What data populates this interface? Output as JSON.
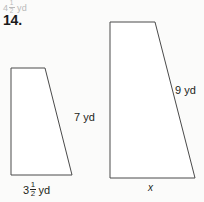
{
  "page": {
    "background_color": "#fbfbfa",
    "stroke_color": "#4a4a4a",
    "shape_fill": "#ffffff",
    "text_color": "#231f20",
    "faded_text_color": "#b9b9b9"
  },
  "carryover": {
    "whole": "4",
    "numerator": "1",
    "denominator": "2",
    "unit": "yd",
    "full_text": "4 1/2 yd"
  },
  "problem": {
    "number": "14."
  },
  "figures": [
    {
      "name": "left-trapezoid",
      "points": "11,68 45,68 72,175 11,175",
      "slant_label": {
        "value": "7",
        "unit": "yd",
        "full_text": "7 yd"
      },
      "base_label": {
        "whole": "3",
        "numerator": "1",
        "denominator": "2",
        "unit": "yd",
        "full_text": "3 1/2 yd"
      }
    },
    {
      "name": "right-trapezoid",
      "points": "110,22 155,22 195,178 110,178",
      "slant_label": {
        "value": "9",
        "unit": "yd",
        "full_text": "9 yd"
      },
      "base_label": {
        "value": "x",
        "full_text": "x"
      }
    }
  ]
}
